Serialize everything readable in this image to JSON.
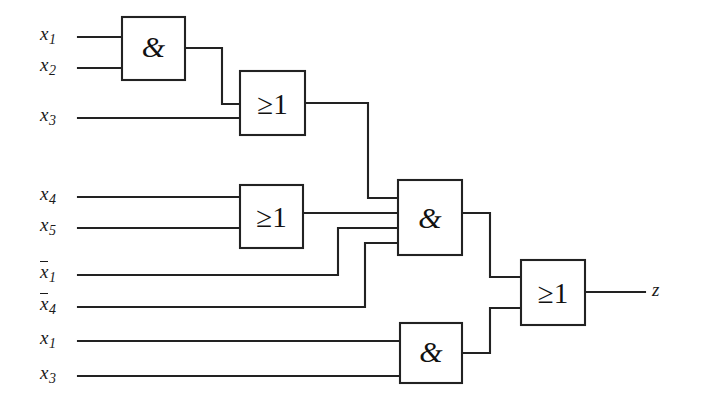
{
  "diagram": {
    "type": "logic-circuit-schematic",
    "line_color": "#222222",
    "background": "#ffffff",
    "output_label": "z"
  },
  "inputs": [
    {
      "id": "in-x1",
      "base": "x",
      "sub": "1",
      "negated": false,
      "label": "x1",
      "y": 37
    },
    {
      "id": "in-x2",
      "base": "x",
      "sub": "2",
      "negated": false,
      "label": "x2",
      "y": 68
    },
    {
      "id": "in-x3",
      "base": "x",
      "sub": "3",
      "negated": false,
      "label": "x3",
      "y": 118
    },
    {
      "id": "in-x4",
      "base": "x",
      "sub": "4",
      "negated": false,
      "label": "x4",
      "y": 197
    },
    {
      "id": "in-x5",
      "base": "x",
      "sub": "5",
      "negated": false,
      "label": "x5",
      "y": 228
    },
    {
      "id": "in-x1-not",
      "base": "x",
      "sub": "1",
      "negated": true,
      "label": "x1",
      "y": 275
    },
    {
      "id": "in-x4-not",
      "base": "x",
      "sub": "4",
      "negated": true,
      "label": "x4",
      "y": 307
    },
    {
      "id": "in-x1-b",
      "base": "x",
      "sub": "1",
      "negated": false,
      "label": "x1",
      "y": 341
    },
    {
      "id": "in-x3-b",
      "base": "x",
      "sub": "3",
      "negated": false,
      "label": "x3",
      "y": 376
    }
  ],
  "gates": [
    {
      "id": "and-1",
      "symbol": "&",
      "kind": "AND",
      "x": 122,
      "y": 17,
      "w": 63,
      "h": 63,
      "inputs": [
        "x1",
        "x2"
      ]
    },
    {
      "id": "or-1",
      "symbol": "≥1",
      "kind": "OR",
      "x": 240,
      "y": 71,
      "w": 65,
      "h": 64,
      "inputs": [
        "and-1",
        "x3"
      ]
    },
    {
      "id": "or-2",
      "symbol": "≥1",
      "kind": "OR",
      "x": 240,
      "y": 185,
      "w": 63,
      "h": 63,
      "inputs": [
        "x4",
        "x5"
      ]
    },
    {
      "id": "and-3",
      "symbol": "&",
      "kind": "AND",
      "x": 398,
      "y": 180,
      "w": 64,
      "h": 75,
      "inputs": [
        "or-1",
        "or-2",
        "x1-not",
        "x4-not"
      ]
    },
    {
      "id": "and-4",
      "symbol": "&",
      "kind": "AND",
      "x": 400,
      "y": 323,
      "w": 62,
      "h": 60,
      "inputs": [
        "x1-b",
        "x3-b"
      ]
    },
    {
      "id": "or-3",
      "symbol": "≥1",
      "kind": "OR",
      "x": 521,
      "y": 260,
      "w": 64,
      "h": 65,
      "inputs": [
        "and-3",
        "and-4"
      ],
      "output": "z"
    }
  ],
  "output": {
    "id": "out-z",
    "label": "z",
    "x": 652,
    "y": 292
  }
}
